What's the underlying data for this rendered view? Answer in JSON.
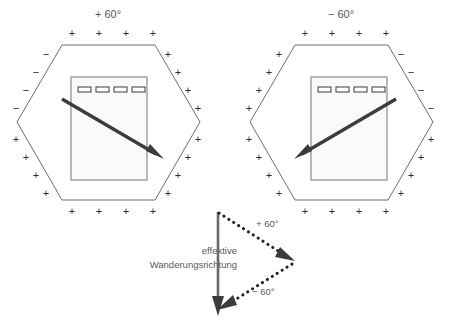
{
  "figure": {
    "title_hidden": "",
    "background_color": "#ffffff",
    "outline_color": "#6e6e70",
    "arrow_color": "#3c3c3e",
    "gel_fill": "#fafafa"
  },
  "panels": [
    {
      "id": "left",
      "angle_label": "+ 60°",
      "angle_value": 60,
      "hexagon_center": [
        108,
        122
      ],
      "electrode_signs": {
        "top": [
          "+",
          "+",
          "+",
          "+"
        ],
        "bottom": [
          "+",
          "+",
          "+",
          "+"
        ],
        "upper_left": [
          "−",
          "−",
          "−",
          "−"
        ],
        "lower_left": [
          "+",
          "+",
          "+",
          "+"
        ],
        "upper_right": [
          "+",
          "+",
          "+",
          "+"
        ],
        "lower_right": [
          "+",
          "+",
          "+",
          "+"
        ]
      },
      "gel": {
        "wells": 4,
        "well_labels": [
          "",
          "",
          "",
          ""
        ]
      },
      "field_arrow": {
        "from": [
          62,
          99
        ],
        "to": [
          162,
          158
        ],
        "direction": "down-right"
      }
    },
    {
      "id": "right",
      "angle_label": "− 60°",
      "angle_value": -60,
      "hexagon_center": [
        341,
        122
      ],
      "electrode_signs": {
        "top": [
          "+",
          "+",
          "+",
          "+"
        ],
        "bottom": [
          "+",
          "+",
          "+",
          "+"
        ],
        "upper_left": [
          "+",
          "+",
          "+",
          "+"
        ],
        "lower_left": [
          "+",
          "+",
          "+",
          "+"
        ],
        "upper_right": [
          "−",
          "−",
          "−",
          "−"
        ],
        "lower_right": [
          "+",
          "+",
          "+",
          "+"
        ]
      },
      "gel": {
        "wells": 4,
        "well_labels": [
          "",
          "",
          "",
          ""
        ]
      },
      "field_arrow": {
        "from": [
          396,
          99
        ],
        "to": [
          294,
          158
        ],
        "direction": "down-left"
      }
    }
  ],
  "vector_diagram": {
    "caption_lines": [
      "effektive",
      "Wanderungsrichtung"
    ],
    "resultant": {
      "label": "",
      "from": [
        218,
        212
      ],
      "to": [
        218,
        314
      ],
      "style": "solid"
    },
    "components": [
      {
        "label": "+ 60°",
        "from": [
          218,
          212
        ],
        "to": [
          290,
          258
        ],
        "style": "dotted"
      },
      {
        "label": "− 60°",
        "from": [
          290,
          262
        ],
        "to": [
          219,
          307
        ],
        "style": "dotted"
      }
    ]
  }
}
